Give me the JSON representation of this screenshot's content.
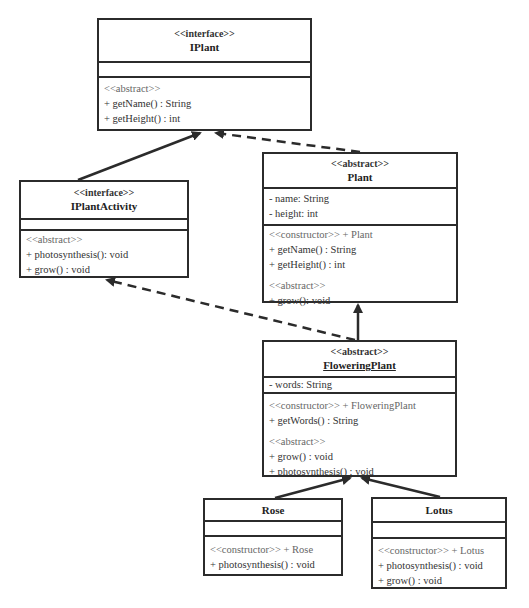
{
  "diagram": {
    "type": "UML class diagram",
    "classes": {
      "iplant": {
        "stereotype": "<<interface>>",
        "name": "IPlant",
        "attributes": [],
        "ops_stereo": "<<abstract>>",
        "operations": [
          "+ getName() : String",
          "+ getHeight() : int"
        ]
      },
      "iplantactivity": {
        "stereotype": "<<interface>>",
        "name": "IPlantActivity",
        "attributes": [],
        "ops_stereo": "<<abstract>>",
        "operations": [
          "+ photosynthesis(): void",
          "+ grow() : void"
        ]
      },
      "plant": {
        "stereotype": "<<abstract>>",
        "name": "Plant",
        "attributes": [
          "- name: String",
          "- height: int"
        ],
        "constructor": "<<constructor>> + Plant",
        "operations": [
          "+ getName() : String",
          "+ getHeight() : int"
        ],
        "abstract_stereo": "<<abstract>>",
        "abstract_ops": [
          "+ grow(): void"
        ]
      },
      "floweringplant": {
        "stereotype": "<<abstract>>",
        "name": "FloweringPlant",
        "attributes": [
          "- words: String"
        ],
        "constructor": "<<constructor>> + FloweringPlant",
        "operations": [
          "+ getWords() : String"
        ],
        "abstract_stereo": "<<abstract>>",
        "abstract_ops": [
          "+ grow() : void",
          "+ photosynthesis() : void"
        ]
      },
      "rose": {
        "name": "Rose",
        "attributes": [],
        "constructor": "<<constructor>> + Rose",
        "operations": [
          "+ photosynthesis() : void"
        ]
      },
      "lotus": {
        "name": "Lotus",
        "attributes": [],
        "constructor": "<<constructor>> + Lotus",
        "operations": [
          "+ photosynthesis() : void",
          "+ grow() : void"
        ]
      }
    },
    "relations": [
      {
        "from": "IPlantActivity",
        "to": "IPlant",
        "kind": "generalization",
        "style": "solid"
      },
      {
        "from": "Plant",
        "to": "IPlant",
        "kind": "realization",
        "style": "dashed"
      },
      {
        "from": "FloweringPlant",
        "to": "IPlantActivity",
        "kind": "realization",
        "style": "dashed"
      },
      {
        "from": "FloweringPlant",
        "to": "Plant",
        "kind": "generalization",
        "style": "solid"
      },
      {
        "from": "Rose",
        "to": "FloweringPlant",
        "kind": "generalization",
        "style": "solid"
      },
      {
        "from": "Lotus",
        "to": "FloweringPlant",
        "kind": "generalization",
        "style": "solid"
      }
    ],
    "colors": {
      "line": "#2b2b2b",
      "background": "#ffffff"
    }
  }
}
